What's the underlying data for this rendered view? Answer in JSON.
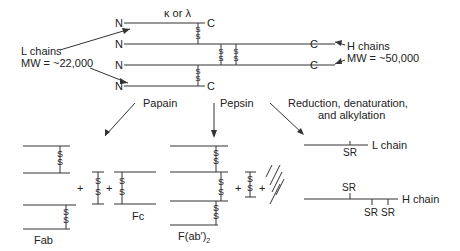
{
  "top": {
    "kappa_lambda": "κ or λ",
    "n_label": "N",
    "c_label": "C",
    "l_chains": "L chains",
    "l_mw": "MW = ~22,000",
    "h_chains": "H chains",
    "h_mw": "MW = ~50,000",
    "disulfide": "S\nS"
  },
  "arrows": {
    "papain": "Papain",
    "pepsin": "Pepsin",
    "reduction_line1": "Reduction, denaturation,",
    "reduction_line2": "and alkylation"
  },
  "products": {
    "fab": "Fab",
    "fc": "Fc",
    "fab2": "F(ab′)",
    "fab2_sub": "2",
    "plus": "+",
    "l_chain": "L chain",
    "h_chain": "H chain",
    "sr": "SR"
  }
}
